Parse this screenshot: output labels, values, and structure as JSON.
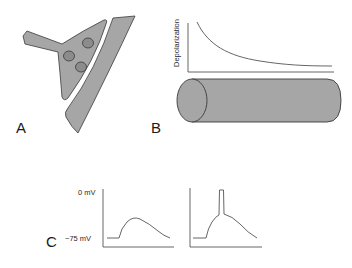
{
  "panels": {
    "a": {
      "label": "A",
      "description": "synapse: presynaptic terminal with three vesicles facing postsynaptic membrane",
      "vesicle_count": 3
    },
    "b": {
      "label": "B",
      "ylabel": "Depolarization",
      "description": "exponential decay of depolarization along a cylindrical dendrite/axon"
    },
    "c": {
      "label": "C",
      "y_ticks": [
        "0 mV",
        "−75 mV"
      ],
      "traces": [
        {
          "name": "subthreshold-potential",
          "has_spike": false
        },
        {
          "name": "potential-with-action-potential",
          "has_spike": true
        }
      ]
    }
  },
  "colors": {
    "fill_gray": "#a6a6a6",
    "vesicle_gray": "#8c8c8c",
    "stroke": "#3a3a3a",
    "line": "#555555"
  }
}
